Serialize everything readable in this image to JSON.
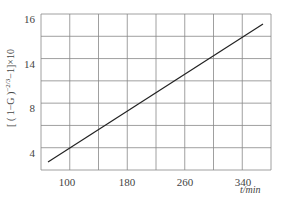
{
  "chart_data": {
    "type": "line",
    "title": "",
    "xlabel": "t/min",
    "ylabel": "[(1-G)^(-2/3) - 1] × 10",
    "x_ticks": [
      100,
      180,
      260,
      340
    ],
    "y_ticks": [
      4,
      8,
      14,
      16
    ],
    "xlim": [
      80,
      380
    ],
    "grid": true,
    "series": [
      {
        "name": "fit",
        "x": [
          85,
          365
        ],
        "y": [
          2.3,
          15.4
        ]
      }
    ]
  },
  "labels": {
    "ylabel_main": "[ ( 1−G )",
    "ylabel_exp": "−2/3",
    "ylabel_tail": "−1]×10",
    "xunit": "t/min"
  },
  "ticks": {
    "x": [
      "100",
      "180",
      "260",
      "340"
    ],
    "y": [
      "16",
      "14",
      "8",
      "4"
    ]
  },
  "colors": {
    "grid": "#888888",
    "line": "#222222",
    "text": "#444444"
  }
}
